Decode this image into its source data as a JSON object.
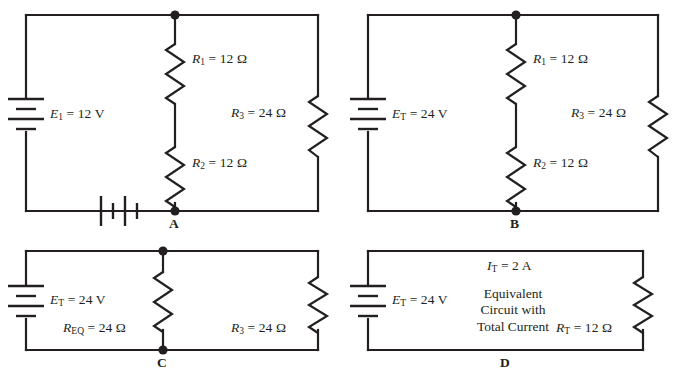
{
  "figure": {
    "width": 678,
    "height": 380,
    "ink_color": "#231f20",
    "background_color": "#ffffff"
  },
  "panels": [
    {
      "id": "A",
      "letter": "A",
      "source_label_html": "<i>E</i><sub>1</sub> = 12 V",
      "source_label_text": "E1 = 12 V",
      "node_label": "A",
      "second_source_present": true,
      "components": [
        {
          "name": "R1",
          "label_html": "<i>R</i><sub>1</sub> = 12 Ω",
          "label_text": "R1 = 12 Ω",
          "value": 12,
          "unit": "Ω"
        },
        {
          "name": "R2",
          "label_html": "<i>R</i><sub>2</sub> = 12 Ω",
          "label_text": "R2 = 12 Ω",
          "value": 12,
          "unit": "Ω"
        },
        {
          "name": "R3",
          "label_html": "<i>R</i><sub>3</sub> = 24 Ω",
          "label_text": "R3 = 24 Ω",
          "value": 24,
          "unit": "Ω"
        }
      ]
    },
    {
      "id": "B",
      "letter": "B",
      "source_label_html": "<i>E</i><sub>T</sub> = 24 V",
      "source_label_text": "ET = 24 V",
      "node_label": "B",
      "second_source_present": false,
      "components": [
        {
          "name": "R1",
          "label_html": "<i>R</i><sub>1</sub> = 12 Ω",
          "label_text": "R1 = 12 Ω",
          "value": 12,
          "unit": "Ω"
        },
        {
          "name": "R2",
          "label_html": "<i>R</i><sub>2</sub> = 12 Ω",
          "label_text": "R2 = 12 Ω",
          "value": 12,
          "unit": "Ω"
        },
        {
          "name": "R3",
          "label_html": "<i>R</i><sub>3</sub> = 24 Ω",
          "label_text": "R3 = 24 Ω",
          "value": 24,
          "unit": "Ω"
        }
      ]
    },
    {
      "id": "C",
      "letter": "C",
      "source_label_html": "<i>E</i><sub>T</sub> = 24 V",
      "source_label_text": "ET = 24 V",
      "node_label": "C",
      "second_source_present": false,
      "components": [
        {
          "name": "REQ",
          "label_html": "<i>R</i><sub>EQ</sub> = 24 Ω",
          "label_text": "REQ = 24 Ω",
          "value": 24,
          "unit": "Ω"
        },
        {
          "name": "R3",
          "label_html": "<i>R</i><sub>3</sub> = 24 Ω",
          "label_text": "R3 = 24 Ω",
          "value": 24,
          "unit": "Ω"
        }
      ]
    },
    {
      "id": "D",
      "letter": "D",
      "source_label_html": "<i>E</i><sub>T</sub> = 24 V",
      "source_label_text": "ET = 24 V",
      "current_label_html": "<i>I</i><sub>T</sub> = 2 A",
      "current_label_text": "IT = 2 A",
      "caption_lines": [
        "Equivalent",
        "Circuit with",
        "Total Current"
      ],
      "caption_text": "Equivalent Circuit with Total Current",
      "node_label": "",
      "second_source_present": false,
      "components": [
        {
          "name": "RT",
          "label_html": "<i>R</i><sub>T</sub> = 12 Ω",
          "label_text": "RT = 12 Ω",
          "value": 12,
          "unit": "Ω"
        }
      ]
    }
  ]
}
